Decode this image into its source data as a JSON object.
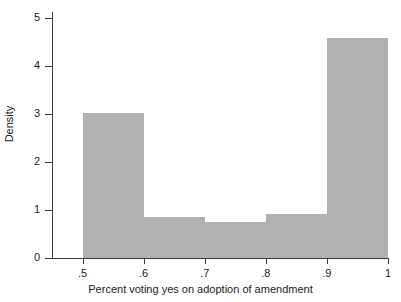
{
  "chart_data": {
    "type": "bar",
    "title": "",
    "subtitle": "",
    "xlabel": "Percent voting yes on adoption of amendment",
    "ylabel": "Density",
    "xlim": [
      0.45,
      1.0
    ],
    "ylim": [
      0,
      5.2
    ],
    "xticks": [
      0.5,
      0.6,
      0.7,
      0.8,
      0.9,
      1.0
    ],
    "xtick_labels": [
      ".5",
      ".6",
      ".7",
      ".8",
      ".9",
      "1"
    ],
    "yticks": [
      0,
      1,
      2,
      3,
      4,
      5
    ],
    "ytick_labels": [
      "0",
      "1",
      "2",
      "3",
      "4",
      "5"
    ],
    "grid": false,
    "legend": null,
    "bar_color": "#b1b1b1",
    "axis_color": "#3b3b3b",
    "bin_edges": [
      0.5,
      0.6,
      0.7,
      0.8,
      0.9,
      1.0
    ],
    "bin_labels": [
      "0.5-0.6",
      "0.6-0.7",
      "0.7-0.8",
      "0.8-0.9",
      "0.9-1.0"
    ],
    "values": [
      3.02,
      0.85,
      0.74,
      0.92,
      4.58
    ],
    "annotations": []
  }
}
